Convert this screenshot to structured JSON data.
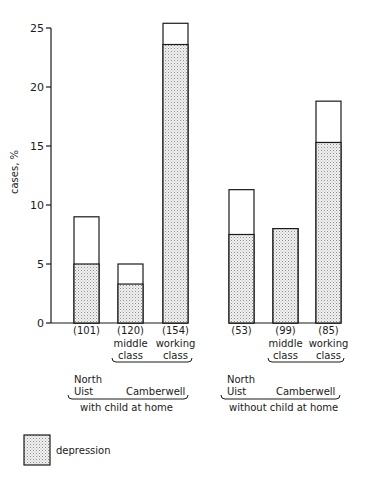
{
  "chart_data": {
    "type": "bar",
    "title": "",
    "xlabel": "",
    "ylabel": "cases, %",
    "ylim": [
      0,
      25
    ],
    "yticks": [
      0,
      5,
      10,
      15,
      20,
      25
    ],
    "grid": false,
    "legend_position": "bottom-left",
    "legend": [
      {
        "label": "depression",
        "pattern": "stippled"
      }
    ],
    "categories": [
      "North Uist (101)",
      "Camberwell middle class (120)",
      "Camberwell working class (154)",
      "North Uist (53)",
      "Camberwell middle class (99)",
      "Camberwell working class (85)"
    ],
    "series": [
      {
        "name": "depression",
        "values": [
          5.0,
          3.3,
          23.6,
          7.5,
          8.0,
          15.3
        ]
      },
      {
        "name": "total cases",
        "values": [
          9.0,
          5.0,
          25.4,
          11.3,
          8.0,
          18.8
        ]
      }
    ],
    "groups": [
      {
        "label": "with child at home",
        "bars": [
          0,
          1,
          2
        ]
      },
      {
        "label": "without child at home",
        "bars": [
          3,
          4,
          5
        ]
      }
    ]
  },
  "axis": {
    "ylabel": "cases, %",
    "ticks": [
      "0",
      "5",
      "10",
      "15",
      "20",
      "25"
    ]
  },
  "bars": [
    {
      "n": "(101)",
      "class_line1": "",
      "class_line2": ""
    },
    {
      "n": "(120)",
      "class_line1": "middle",
      "class_line2": "class"
    },
    {
      "n": "(154)",
      "class_line1": "working",
      "class_line2": "class"
    },
    {
      "n": "(53)",
      "class_line1": "",
      "class_line2": ""
    },
    {
      "n": "(99)",
      "class_line1": "middle",
      "class_line2": "class"
    },
    {
      "n": "(85)",
      "class_line1": "working",
      "class_line2": "class"
    }
  ],
  "groups": [
    {
      "place1_line1": "North",
      "place1_line2": "Uist",
      "place2": "Camberwell",
      "label": "with child at home"
    },
    {
      "place1_line1": "North",
      "place1_line2": "Uist",
      "place2": "Camberwell",
      "label": "without child at home"
    }
  ],
  "legend": {
    "label": "depression"
  }
}
